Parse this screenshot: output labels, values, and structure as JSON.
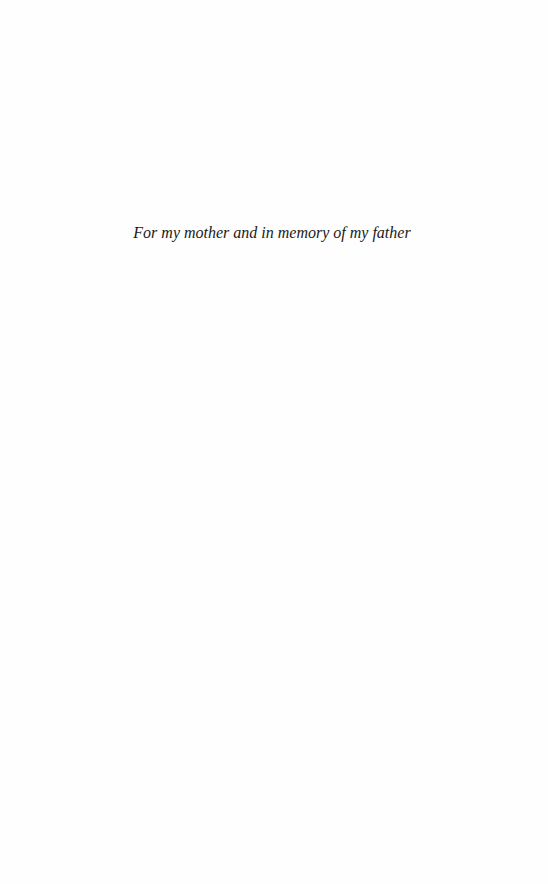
{
  "page": {
    "type": "dedication",
    "dedication_text": "For my mother and in memory of my father"
  }
}
